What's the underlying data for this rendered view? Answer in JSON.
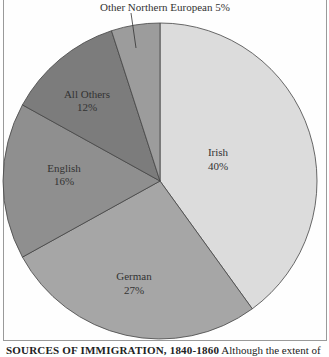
{
  "chart_data": {
    "type": "pie",
    "title": "Sources of Immigration, 1840-1860",
    "categories": [
      "Irish",
      "German",
      "English",
      "All Others",
      "Other Northern European"
    ],
    "values": [
      40,
      27,
      16,
      12,
      5
    ],
    "unit": "%",
    "colors": [
      "#dcdcdc",
      "#a6a6a6",
      "#8f8f8f",
      "#7c7c7c",
      "#9c9c9c"
    ],
    "labels": [
      "Irish 40%",
      "German 27%",
      "English 16%",
      "All Others 12%",
      "Other Northern European 5%"
    ],
    "start_angle": "12 o'clock, clockwise"
  },
  "slices": [
    {
      "name": "Irish",
      "pct": "40%"
    },
    {
      "name": "German",
      "pct": "27%"
    },
    {
      "name": "English",
      "pct": "16%"
    },
    {
      "name": "All Others",
      "pct": "12%"
    },
    {
      "name": "Other Northern European",
      "pct": "5%"
    }
  ],
  "callout": {
    "text": "Other Northern European 5%"
  },
  "caption": {
    "heading": "SOURCES OF IMMIGRATION, 1840-1860",
    "text": "Although the extent of"
  }
}
